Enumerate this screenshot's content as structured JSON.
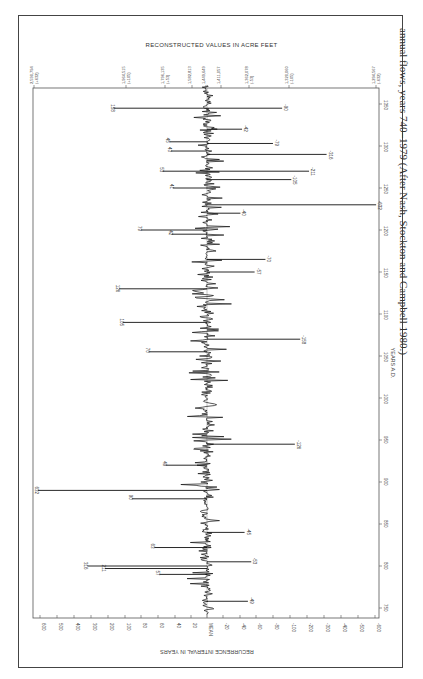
{
  "chart_data": {
    "type": "line",
    "title": "RECONSTRUCTED VALUES IN ACRE FEET",
    "xlabel": "YEARS A.D.",
    "ylabel": "RECURRENCE INTERVAL IN YEARS",
    "orientation": "rotated 90 degrees (years run along vertical axis, values along horizontal)",
    "year_ticks": [
      750,
      800,
      850,
      900,
      950,
      1000,
      1050,
      1100,
      1150,
      1200,
      1250,
      1300,
      1350
    ],
    "year_range": [
      740,
      1370
    ],
    "recurrence_ticks": [
      "600",
      "500",
      "400",
      "300",
      "200",
      "100",
      "80",
      "60",
      "40",
      "20",
      "MEAN",
      "-20",
      "-40",
      "-60",
      "-80",
      "-100",
      "-200",
      "-300",
      "-400",
      "-500",
      "-600"
    ],
    "value_ticks": [
      {
        "value": "2,590,794",
        "interval": "(+632)"
      },
      {
        "value": "1,964,515",
        "interval": "(+105)"
      },
      {
        "value": "1,796,135",
        "interval": "(+53)"
      },
      {
        "value": "1,582,813",
        "interval": ""
      },
      {
        "value": "1,449,649",
        "interval": ""
      },
      {
        "value": "1,411,057",
        "interval": ""
      },
      {
        "value": "1,362,078",
        "interval": "(-53)"
      },
      {
        "value": "1,320,060",
        "interval": "(-105)"
      },
      {
        "value": "1,294,567",
        "interval": "(-632)"
      }
    ],
    "labeled_events": [
      {
        "year": 1345,
        "interval": 158
      },
      {
        "year": 1345,
        "interval": -90
      },
      {
        "year": 1320,
        "interval": -42
      },
      {
        "year": 1305,
        "interval": 45
      },
      {
        "year": 1303,
        "interval": -79
      },
      {
        "year": 1294,
        "interval": 43
      },
      {
        "year": 1290,
        "interval": -316
      },
      {
        "year": 1270,
        "interval": -211
      },
      {
        "year": 1270,
        "interval": 53
      },
      {
        "year": 1260,
        "interval": -105
      },
      {
        "year": 1250,
        "interval": 41
      },
      {
        "year": 1230,
        "interval": -632
      },
      {
        "year": 1220,
        "interval": -40
      },
      {
        "year": 1200,
        "interval": 79
      },
      {
        "year": 1195,
        "interval": 42
      },
      {
        "year": 1165,
        "interval": -70
      },
      {
        "year": 1150,
        "interval": -57
      },
      {
        "year": 1130,
        "interval": 126
      },
      {
        "year": 1090,
        "interval": 105
      },
      {
        "year": 1070,
        "interval": -158
      },
      {
        "year": 1055,
        "interval": 70
      },
      {
        "year": 945,
        "interval": -126
      },
      {
        "year": 920,
        "interval": 49
      },
      {
        "year": 890,
        "interval": 632
      },
      {
        "year": 880,
        "interval": 90
      },
      {
        "year": 840,
        "interval": -45
      },
      {
        "year": 822,
        "interval": 63
      },
      {
        "year": 805,
        "interval": -53
      },
      {
        "year": 800,
        "interval": 316
      },
      {
        "year": 797,
        "interval": 211
      },
      {
        "year": 790,
        "interval": 57
      },
      {
        "year": 758,
        "interval": -49
      }
    ],
    "grid": false,
    "legend": "none"
  },
  "figure": {
    "title": "RECONSTRUCTED VALUES IN ACRE FEET",
    "bottom_axis_title": "RECURRENCE INTERVAL IN YEARS",
    "year_axis_title": "YEARS A.D.",
    "caption": "annual flows, years 740–1979 (After Nash, Stockton and Campbell 1980.)"
  }
}
